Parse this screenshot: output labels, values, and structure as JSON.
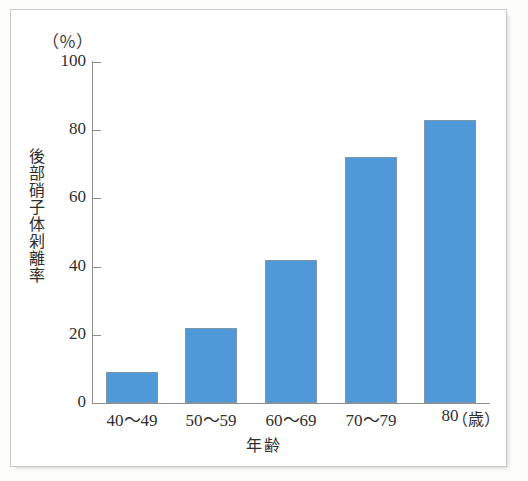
{
  "chart_data": {
    "type": "bar",
    "title": "",
    "subtitle": "",
    "categories": [
      "40～49",
      "50～59",
      "60～69",
      "70～79",
      "80"
    ],
    "values": [
      9,
      22,
      42,
      72,
      83
    ],
    "xlabel": "年齢",
    "xunit": "（歳）",
    "ylabel": "後部硝子体剁離率",
    "yunit": "（％）",
    "ylim": [
      0,
      100
    ],
    "ytick_labels": [
      "100",
      "80",
      "60",
      "40",
      "20",
      "0"
    ],
    "ytick_values": [
      100,
      80,
      60,
      40,
      20,
      0
    ],
    "grid": false,
    "legend": false,
    "legend_position": "none",
    "bar_color": "#5099d8",
    "bar_border_color": "#7f96a8",
    "axis_color": "#8e8e8e",
    "background_color": "#ffffff",
    "frame_color": "#c9c9c7"
  }
}
